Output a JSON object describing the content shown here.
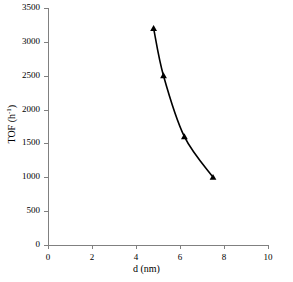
{
  "chart_data": {
    "type": "line",
    "title": "",
    "subtitle": "",
    "xlabel": "d (nm)",
    "ylabel": "TOF (h-1)",
    "ylabel_base": "TOF (h",
    "ylabel_exponent": "-1",
    "ylabel_tail": ")",
    "xlim": [
      0,
      10
    ],
    "ylim": [
      0,
      3500
    ],
    "grid": false,
    "legend": "none",
    "marker": "triangle",
    "line_color": "#000000",
    "marker_color": "#000000",
    "axis_color": "#808080",
    "background": "#ffffff",
    "x": [
      4.8,
      5.25,
      6.2,
      7.5
    ],
    "y": [
      3200,
      2500,
      1600,
      1000
    ],
    "points": [
      {
        "x": 4.8,
        "y": 3200
      },
      {
        "x": 5.25,
        "y": 2500
      },
      {
        "x": 6.2,
        "y": 1600
      },
      {
        "x": 7.5,
        "y": 1000
      }
    ],
    "xticks": [
      0,
      2,
      4,
      6,
      8,
      10
    ],
    "xtick_labels": [
      "0",
      "2",
      "4",
      "6",
      "8",
      "10"
    ],
    "yticks": [
      0,
      500,
      1000,
      1500,
      2000,
      2500,
      3000,
      3500
    ],
    "ytick_labels": [
      "0",
      "500",
      "1000",
      "1500",
      "2000",
      "2500",
      "3000",
      "3500"
    ]
  }
}
